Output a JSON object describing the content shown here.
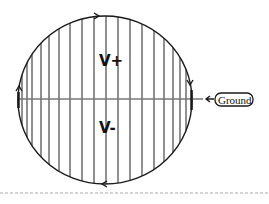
{
  "diagram": {
    "labels": {
      "upper": "V+",
      "lower": "V-",
      "ground": "Ground"
    },
    "circle": {
      "cx": 105,
      "cy": 100,
      "rx": 87,
      "ry": 84
    },
    "axis_y": 99,
    "vertical_lines_x": [
      22,
      27,
      32,
      41,
      49,
      59,
      70,
      82,
      94,
      106,
      118,
      130,
      142,
      154,
      164,
      173,
      180,
      186
    ],
    "flow_arrows": [
      {
        "position": "top",
        "direction": "right"
      },
      {
        "position": "right",
        "direction": "down"
      },
      {
        "position": "bottom",
        "direction": "left"
      },
      {
        "position": "left",
        "direction": "up"
      }
    ],
    "colors": {
      "stroke": "#1a1a1a",
      "lines": "#555555",
      "axis": "#777777",
      "dashed": "#aaaaaa"
    }
  }
}
